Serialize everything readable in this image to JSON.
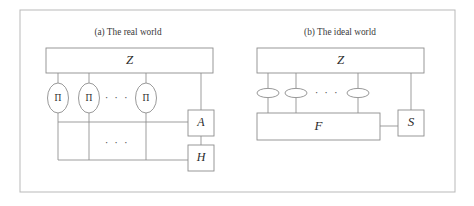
{
  "figure": {
    "background_color": "#ffffff",
    "frame": {
      "stroke": "#b9b9b9",
      "x": 20,
      "y": 10,
      "width": 435,
      "height": 182
    },
    "panels": [
      {
        "id": "real-world",
        "caption": "(a) The real world",
        "caption_x": 128,
        "caption_y": 33,
        "environment": {
          "label": "Z",
          "x": 46,
          "y": 48,
          "width": 167,
          "height": 25
        },
        "protocol_parties": [
          {
            "label": "Π",
            "cx": 58,
            "cy": 98
          },
          {
            "label": "Π",
            "cx": 89,
            "cy": 98
          },
          {
            "label": "Π",
            "cx": 146,
            "cy": 98
          }
        ],
        "party_ellipse_rx": 10.5,
        "party_ellipse_ry": 15,
        "ellipsis_upper": {
          "text": "· · ·",
          "x": 117,
          "y": 98
        },
        "ellipsis_lower": {
          "text": "· · ·",
          "x": 117,
          "y": 143
        },
        "adversary": {
          "label": "A",
          "x": 188,
          "y": 110,
          "width": 26,
          "height": 26
        },
        "functionality_or_honest": {
          "label": "H",
          "x": 188,
          "y": 145,
          "width": 26,
          "height": 26
        },
        "bus_upper_y": 122,
        "bus_lower_y": 160
      },
      {
        "id": "ideal-world",
        "caption": "(b) The ideal world",
        "caption_x": 340,
        "caption_y": 33,
        "environment": {
          "label": "Z",
          "x": 257,
          "y": 48,
          "width": 167,
          "height": 25
        },
        "dummy_parties": [
          {
            "cx": 268,
            "cy": 93
          },
          {
            "cx": 296,
            "cy": 93
          },
          {
            "cx": 358,
            "cy": 93
          }
        ],
        "party_ellipse_rx": 11,
        "party_ellipse_ry": 4.6,
        "ellipsis_upper": {
          "text": "· · ·",
          "x": 327,
          "y": 93
        },
        "ideal_functionality": {
          "label": "F",
          "x": 257,
          "y": 113,
          "width": 123,
          "height": 27
        },
        "simulator": {
          "label": "S",
          "x": 398,
          "y": 110,
          "width": 26,
          "height": 26
        },
        "sim_link_y": 126,
        "sim_trunk_x": 411
      }
    ],
    "colors": {
      "box_stroke": "#8d8d8d",
      "wire_stroke": "#8d8d8d",
      "frame_stroke": "#b9b9b9",
      "text": "#2b2b2b",
      "caption_text": "#3a3a3a"
    }
  }
}
